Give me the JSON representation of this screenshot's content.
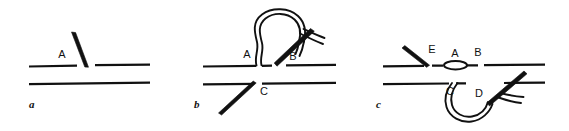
{
  "figure": {
    "background_color": "#ffffff",
    "ink_color": "#111111",
    "panels": [
      {
        "id": "a",
        "letter": "a",
        "caption_position": "bottom-left",
        "point_labels": [
          "A"
        ],
        "elements": [
          "upper-fabric-edge",
          "lower-fabric-edge",
          "needle-a"
        ]
      },
      {
        "id": "b",
        "letter": "b",
        "caption_position": "bottom-left",
        "point_labels": [
          "A",
          "B",
          "C"
        ],
        "elements": [
          "upper-fabric-edge",
          "lower-fabric-edge",
          "thread-loop-upper",
          "needle-b",
          "needle-c"
        ]
      },
      {
        "id": "c",
        "letter": "c",
        "caption_position": "bottom-left",
        "point_labels": [
          "E",
          "A",
          "B",
          "C",
          "D"
        ],
        "elements": [
          "upper-fabric-edge",
          "lower-fabric-edge",
          "needle-e",
          "stitch-oval",
          "thread-loop-lower",
          "needle-d"
        ]
      }
    ]
  },
  "panel_a": {
    "letter": "a",
    "label_A": "A"
  },
  "panel_b": {
    "letter": "b",
    "label_A": "A",
    "label_B": "B",
    "label_C": "C"
  },
  "panel_c": {
    "letter": "c",
    "label_E": "E",
    "label_A": "A",
    "label_B": "B",
    "label_C": "C",
    "label_D": "D"
  }
}
